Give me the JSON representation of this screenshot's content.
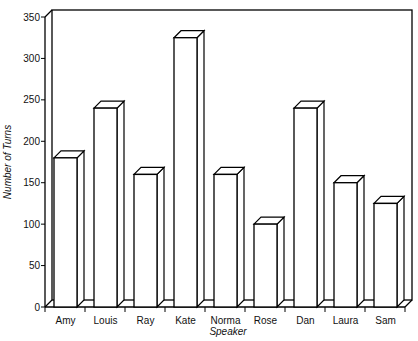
{
  "chart_data": {
    "type": "bar",
    "style": "3d",
    "title": "",
    "xlabel": "Speaker",
    "ylabel": "Number of Turns",
    "categories": [
      "Amy",
      "Louis",
      "Ray",
      "Kate",
      "Norma",
      "Rose",
      "Dan",
      "Laura",
      "Sam"
    ],
    "values": [
      180,
      240,
      160,
      325,
      160,
      100,
      240,
      150,
      125
    ],
    "ylim": [
      0,
      350
    ],
    "yticks": [
      0,
      50,
      100,
      150,
      200,
      250,
      300,
      350
    ],
    "grid": false,
    "legend": null,
    "colors": {
      "bar_fill": "#ffffff",
      "bar_stroke": "#000000",
      "frame": "#000000"
    }
  }
}
